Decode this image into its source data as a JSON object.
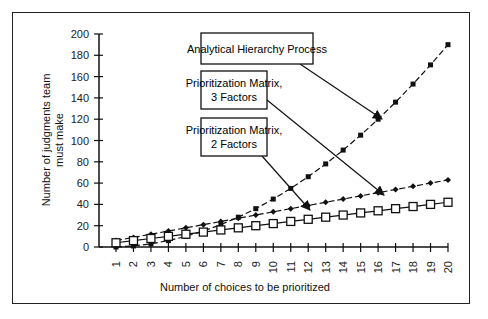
{
  "chart_data": {
    "type": "line",
    "title": "",
    "xlabel": "Number of choices to be prioritized",
    "ylabel": "Number of judgments team must make",
    "ylabel_lines": [
      "Number of judgments team",
      "must make"
    ],
    "xlim": [
      1,
      20
    ],
    "ylim": [
      0,
      200
    ],
    "yticks": [
      0,
      20,
      40,
      60,
      80,
      100,
      120,
      140,
      160,
      180,
      200
    ],
    "x": [
      1,
      2,
      3,
      4,
      5,
      6,
      7,
      8,
      9,
      10,
      11,
      12,
      13,
      14,
      15,
      16,
      17,
      18,
      19,
      20
    ],
    "series": [
      {
        "name": "Analytical Hierarchy Process",
        "marker": "filled-square",
        "values": [
          0,
          1,
          3,
          6,
          10,
          15,
          21,
          28,
          36,
          45,
          55,
          66,
          78,
          91,
          105,
          120,
          136,
          153,
          171,
          190
        ]
      },
      {
        "name": "Prioritization Matrix, 3 Factors",
        "marker": "diamond",
        "values": [
          6,
          9,
          12,
          15,
          18,
          21,
          24,
          27,
          30,
          33,
          36,
          39,
          42,
          45,
          48,
          51,
          54,
          57,
          60,
          63
        ]
      },
      {
        "name": "Prioritization Matrix, 2 Factors",
        "marker": "open-square",
        "values": [
          4,
          6,
          8,
          10,
          12,
          14,
          16,
          18,
          20,
          22,
          24,
          26,
          28,
          30,
          32,
          34,
          36,
          38,
          40,
          42
        ]
      }
    ],
    "annotations": [
      {
        "text_lines": [
          "Analytical Hierarchy Process"
        ],
        "points_to_x": 16.5
      },
      {
        "text_lines": [
          "Prioritization Matrix,",
          "3 Factors"
        ],
        "points_to_x": 16.5
      },
      {
        "text_lines": [
          "Prioritization Matrix,",
          "2 Factors"
        ],
        "points_to_x": 12.5
      }
    ],
    "grid": false,
    "legend": "callout boxes"
  }
}
